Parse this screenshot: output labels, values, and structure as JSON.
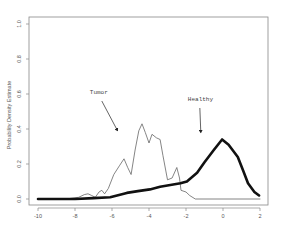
{
  "chart_data": {
    "type": "line",
    "title": "",
    "xlabel": "",
    "ylabel": "Probability Density Estimate",
    "xlim": [
      -10,
      2
    ],
    "ylim": [
      0.0,
      1.0
    ],
    "x_ticks": [
      -10,
      -8,
      -6,
      -4,
      -2,
      0,
      2
    ],
    "y_ticks": [
      0.0,
      0.2,
      0.4,
      0.6,
      0.8,
      1.0
    ],
    "x_tick_labels": [
      "-10",
      "-8",
      "-6",
      "-4",
      "-2",
      "0",
      "2"
    ],
    "y_tick_labels": [
      "0.0",
      "0.2",
      "0.4",
      "0.6",
      "0.8",
      "1.0"
    ],
    "grid": false,
    "legend": null,
    "series": [
      {
        "name": "Tumor",
        "style": "thin",
        "color": "#666666",
        "points": [
          [
            -10,
            0.0
          ],
          [
            -8.5,
            0.0
          ],
          [
            -7.8,
            0.01
          ],
          [
            -7.5,
            0.025
          ],
          [
            -7.3,
            0.03
          ],
          [
            -7.1,
            0.02
          ],
          [
            -6.9,
            0.01
          ],
          [
            -6.7,
            0.04
          ],
          [
            -6.55,
            0.05
          ],
          [
            -6.4,
            0.03
          ],
          [
            -6.2,
            0.06
          ],
          [
            -5.9,
            0.14
          ],
          [
            -5.6,
            0.19
          ],
          [
            -5.35,
            0.23
          ],
          [
            -5.15,
            0.18
          ],
          [
            -4.97,
            0.14
          ],
          [
            -4.75,
            0.28
          ],
          [
            -4.55,
            0.39
          ],
          [
            -4.38,
            0.43
          ],
          [
            -4.2,
            0.38
          ],
          [
            -4.0,
            0.32
          ],
          [
            -3.84,
            0.37
          ],
          [
            -3.6,
            0.35
          ],
          [
            -3.4,
            0.34
          ],
          [
            -3.25,
            0.25
          ],
          [
            -3.0,
            0.11
          ],
          [
            -2.75,
            0.12
          ],
          [
            -2.5,
            0.18
          ],
          [
            -2.35,
            0.12
          ],
          [
            -2.27,
            0.05
          ],
          [
            -2.0,
            0.04
          ],
          [
            -1.8,
            0.02
          ],
          [
            -1.5,
            0.0
          ],
          [
            0.0,
            0.0
          ],
          [
            2.0,
            0.0
          ]
        ]
      },
      {
        "name": "Healthy",
        "style": "thick",
        "color": "#111111",
        "points": [
          [
            -10,
            0.0
          ],
          [
            -8.0,
            0.0
          ],
          [
            -7.0,
            0.005
          ],
          [
            -6.1,
            0.01
          ],
          [
            -5.2,
            0.035
          ],
          [
            -4.6,
            0.045
          ],
          [
            -3.95,
            0.055
          ],
          [
            -3.4,
            0.07
          ],
          [
            -2.85,
            0.08
          ],
          [
            -2.3,
            0.09
          ],
          [
            -1.95,
            0.1
          ],
          [
            -1.4,
            0.15
          ],
          [
            -1.0,
            0.21
          ],
          [
            -0.5,
            0.28
          ],
          [
            -0.05,
            0.34
          ],
          [
            0.3,
            0.31
          ],
          [
            0.8,
            0.24
          ],
          [
            1.1,
            0.16
          ],
          [
            1.35,
            0.09
          ],
          [
            1.7,
            0.04
          ],
          [
            1.95,
            0.02
          ]
        ]
      }
    ],
    "annotations": [
      {
        "text": "Tumor",
        "label_x": -7.2,
        "label_y": 0.6,
        "arrow_to": [
          -5.7,
          0.39
        ]
      },
      {
        "text": "Healthy",
        "label_x": -1.9,
        "label_y": 0.56,
        "arrow_to": [
          -1.2,
          0.38
        ]
      }
    ]
  }
}
